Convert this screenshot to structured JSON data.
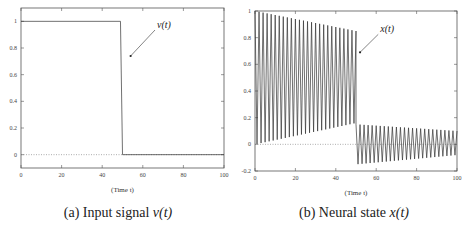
{
  "chart_data": [
    {
      "type": "line",
      "id": "a",
      "caption": "(a) Input signal v(t)",
      "caption_prefix": "(a) Input signal ",
      "caption_math": "v(t)",
      "title": "",
      "xlabel": "(Time t)",
      "ylabel": "",
      "xlim": [
        0,
        100
      ],
      "ylim": [
        -0.1,
        1.1
      ],
      "xticks": [
        0,
        20,
        40,
        60,
        80,
        100
      ],
      "xtick_labels": [
        "0",
        "20",
        "40",
        "60",
        "80",
        "100"
      ],
      "yticks": [
        0,
        0.2,
        0.4,
        0.6,
        0.8,
        1
      ],
      "ytick_labels": [
        "0",
        "0.2",
        "0.4",
        "0.6",
        "0.8",
        "1"
      ],
      "grid": false,
      "legend": null,
      "annotation": {
        "text": "v(t)",
        "text_x": 67,
        "text_y": 0.95,
        "arrow_to_x": 54,
        "arrow_to_y": 0.74
      },
      "reference_line": {
        "y": 0,
        "style": "dotted"
      },
      "series": [
        {
          "name": "v(t)",
          "x": [
            0,
            49,
            50,
            100
          ],
          "values": [
            1,
            1,
            0,
            0
          ]
        }
      ]
    },
    {
      "type": "line",
      "id": "b",
      "caption": "(b) Neural state x(t)",
      "caption_prefix": "(b) Neural state ",
      "caption_math": "x(t)",
      "title": "",
      "xlabel": "(Time t)",
      "ylabel": "",
      "xlim": [
        0,
        100
      ],
      "ylim": [
        -0.2,
        1.0
      ],
      "xticks": [
        0,
        20,
        40,
        60,
        80,
        100
      ],
      "xtick_labels": [
        "0",
        "20",
        "40",
        "60",
        "80",
        "100"
      ],
      "yticks": [
        -0.2,
        0,
        0.2,
        0.4,
        0.6,
        0.8,
        1
      ],
      "ytick_labels": [
        "-0.2",
        "0",
        "0.2",
        "0.4",
        "0.6",
        "0.8",
        "1"
      ],
      "grid": false,
      "legend": null,
      "annotation": {
        "text": "x(t)",
        "text_x": 62,
        "text_y": 0.84,
        "arrow_to_x": 52,
        "arrow_to_y": 0.69
      },
      "reference_line": {
        "y": 0,
        "style": "dotted"
      },
      "series": [
        {
          "name": "x(t)",
          "description": "Rapid oscillation; for t<50 peaks decay from ~1.0 to ~0.85 and troughs rise from ~0.0 to ~0.15; after t=50 oscillates between ~0.15 and ~-0.15, amplitude decaying to ~0.1/-0.08 at t=100",
          "period": 2.0,
          "segments": [
            {
              "t_start": 0,
              "t_end": 50,
              "peak_start": 1.0,
              "peak_end": 0.85,
              "trough_start": 0.0,
              "trough_end": 0.16
            },
            {
              "t_start": 50,
              "t_end": 100,
              "peak_start": 0.15,
              "peak_end": 0.1,
              "trough_start": -0.15,
              "trough_end": -0.08
            }
          ]
        }
      ]
    }
  ]
}
